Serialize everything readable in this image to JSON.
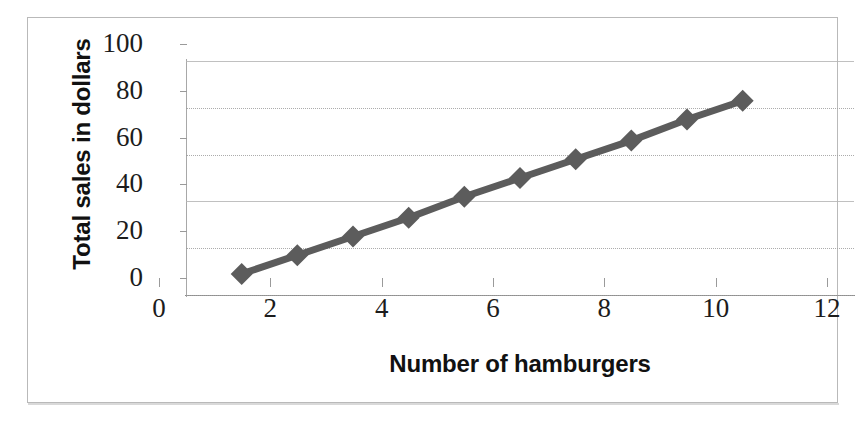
{
  "scan": {
    "clipped_caption_fragment": "Hamburger Sales at the Diner"
  },
  "chart_data": {
    "type": "line",
    "title": "",
    "xlabel": "Number of hamburgers",
    "ylabel": "Total sales in dollars",
    "x": [
      1,
      2,
      3,
      4,
      5,
      6,
      7,
      8,
      9,
      10
    ],
    "values": [
      9,
      17,
      25,
      33,
      42,
      50,
      58,
      66,
      75,
      83
    ],
    "series": [
      {
        "name": "Total sales",
        "values": [
          9,
          17,
          25,
          33,
          42,
          50,
          58,
          66,
          75,
          83
        ]
      }
    ],
    "xlim": [
      0,
      12
    ],
    "ylim": [
      0,
      100
    ],
    "x_ticks": [
      0,
      2,
      4,
      6,
      8,
      10,
      12
    ],
    "y_ticks": [
      0,
      20,
      40,
      60,
      80,
      100
    ],
    "x_tick_labels": [
      "0",
      "2",
      "4",
      "6",
      "8",
      "10",
      "12"
    ],
    "y_tick_labels": [
      "0",
      "20",
      "40",
      "60",
      "80",
      "100"
    ],
    "grid": true,
    "grid_axis": "y",
    "legend": false,
    "legend_position": "none",
    "marker": "diamond",
    "series_color": "#5c5c5c",
    "grid_color": "#9e9e9e",
    "axis_color": "#8f8f8f",
    "annotations": []
  }
}
